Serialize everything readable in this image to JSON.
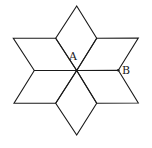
{
  "diagram": {
    "type": "six-pointed star of rhombuses",
    "labels": [
      {
        "id": "A",
        "text": "A",
        "x": 69,
        "y": 60
      },
      {
        "id": "B",
        "text": "B",
        "x": 122,
        "y": 74
      }
    ],
    "vertices": {
      "center": [
        76.7,
        70.5
      ],
      "top": [
        76.7,
        6
      ],
      "bottom": [
        76.7,
        135
      ],
      "upper_inner_left": [
        55.7,
        38.3
      ],
      "upper_inner_right": [
        96.7,
        38.3
      ],
      "far_upper_left": [
        13.3,
        38.3
      ],
      "far_upper_right": [
        138.3,
        38
      ],
      "mid_left": [
        34.3,
        70.5
      ],
      "mid_right_B": [
        118.3,
        70.3
      ],
      "far_lower_left": [
        14,
        103.3
      ],
      "far_lower_right": [
        138.3,
        103
      ],
      "lower_inner_left": [
        55.7,
        103.3
      ],
      "lower_inner_right": [
        96.7,
        103.3
      ]
    },
    "stroke_color": "#1a1a1a",
    "background": "#ffffff"
  }
}
